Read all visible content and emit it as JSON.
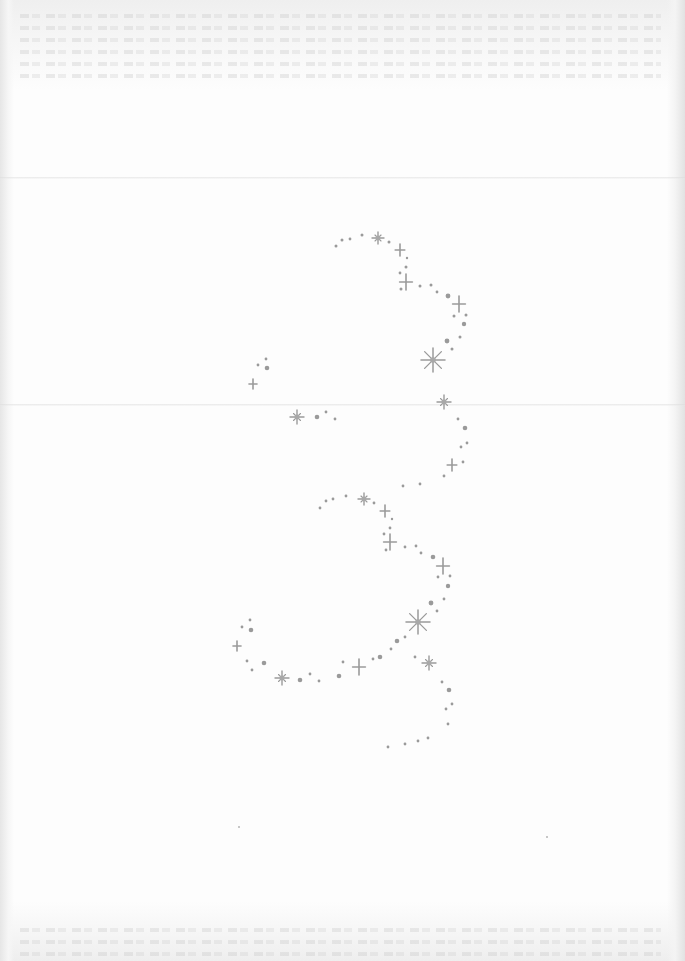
{
  "document": {
    "type": "scanned blank stationery page",
    "background_color": "#fdfdfd",
    "ornament_color": "#9a9a9a",
    "fold_lines_y": [
      177,
      404
    ],
    "bleed_through_rows_y": [
      14,
      26,
      38,
      50,
      62,
      74,
      928,
      940,
      952
    ],
    "specks": [
      {
        "x": 238,
        "y": 826
      },
      {
        "x": 546,
        "y": 836
      }
    ]
  },
  "ornament": {
    "name": "sparkle swirl",
    "stars": [
      {
        "x": 378,
        "y": 238,
        "r": 6,
        "kind": "burst"
      },
      {
        "x": 400,
        "y": 250,
        "r": 6,
        "kind": "cross"
      },
      {
        "x": 406,
        "y": 282,
        "r": 8,
        "kind": "cross"
      },
      {
        "x": 459,
        "y": 304,
        "r": 8,
        "kind": "cross"
      },
      {
        "x": 433,
        "y": 360,
        "r": 12,
        "kind": "burst8"
      },
      {
        "x": 253,
        "y": 384,
        "r": 5,
        "kind": "cross"
      },
      {
        "x": 297,
        "y": 417,
        "r": 7,
        "kind": "burst"
      },
      {
        "x": 444,
        "y": 402,
        "r": 7,
        "kind": "burst"
      },
      {
        "x": 452,
        "y": 465,
        "r": 6,
        "kind": "cross"
      },
      {
        "x": 364,
        "y": 499,
        "r": 6,
        "kind": "burst"
      },
      {
        "x": 385,
        "y": 511,
        "r": 6,
        "kind": "cross"
      },
      {
        "x": 390,
        "y": 542,
        "r": 8,
        "kind": "cross"
      },
      {
        "x": 443,
        "y": 566,
        "r": 8,
        "kind": "cross"
      },
      {
        "x": 418,
        "y": 622,
        "r": 12,
        "kind": "burst8"
      },
      {
        "x": 237,
        "y": 646,
        "r": 5,
        "kind": "cross"
      },
      {
        "x": 282,
        "y": 678,
        "r": 7,
        "kind": "burst"
      },
      {
        "x": 359,
        "y": 667,
        "r": 8,
        "kind": "cross"
      },
      {
        "x": 429,
        "y": 663,
        "r": 7,
        "kind": "burst"
      }
    ],
    "dots": [
      {
        "x": 336,
        "y": 246,
        "r": 1.5
      },
      {
        "x": 342,
        "y": 240,
        "r": 1.5
      },
      {
        "x": 350,
        "y": 239,
        "r": 1.4
      },
      {
        "x": 362,
        "y": 235,
        "r": 1.5
      },
      {
        "x": 389,
        "y": 242,
        "r": 1.5
      },
      {
        "x": 407,
        "y": 258,
        "r": 1.2
      },
      {
        "x": 406,
        "y": 267,
        "r": 1.5
      },
      {
        "x": 400,
        "y": 273,
        "r": 1.4
      },
      {
        "x": 401,
        "y": 289,
        "r": 1.5
      },
      {
        "x": 420,
        "y": 286,
        "r": 1.5
      },
      {
        "x": 431,
        "y": 285,
        "r": 1.5
      },
      {
        "x": 437,
        "y": 292,
        "r": 1.4
      },
      {
        "x": 448,
        "y": 296,
        "r": 2.4
      },
      {
        "x": 454,
        "y": 316,
        "r": 1.5
      },
      {
        "x": 466,
        "y": 315,
        "r": 1.5
      },
      {
        "x": 464,
        "y": 324,
        "r": 2.2
      },
      {
        "x": 460,
        "y": 337,
        "r": 1.5
      },
      {
        "x": 447,
        "y": 341,
        "r": 2.4
      },
      {
        "x": 452,
        "y": 349,
        "r": 1.5
      },
      {
        "x": 266,
        "y": 359,
        "r": 1.4
      },
      {
        "x": 258,
        "y": 365,
        "r": 1.4
      },
      {
        "x": 267,
        "y": 368,
        "r": 2.3
      },
      {
        "x": 317,
        "y": 417,
        "r": 2.3
      },
      {
        "x": 326,
        "y": 412,
        "r": 1.4
      },
      {
        "x": 335,
        "y": 419,
        "r": 1.4
      },
      {
        "x": 458,
        "y": 419,
        "r": 1.4
      },
      {
        "x": 465,
        "y": 428,
        "r": 2.3
      },
      {
        "x": 467,
        "y": 443,
        "r": 1.4
      },
      {
        "x": 461,
        "y": 447,
        "r": 1.4
      },
      {
        "x": 463,
        "y": 462,
        "r": 1.4
      },
      {
        "x": 444,
        "y": 476,
        "r": 1.4
      },
      {
        "x": 420,
        "y": 484,
        "r": 1.4
      },
      {
        "x": 403,
        "y": 486,
        "r": 1.4
      },
      {
        "x": 320,
        "y": 508,
        "r": 1.4
      },
      {
        "x": 326,
        "y": 501,
        "r": 1.4
      },
      {
        "x": 333,
        "y": 499,
        "r": 1.4
      },
      {
        "x": 346,
        "y": 496,
        "r": 1.4
      },
      {
        "x": 374,
        "y": 503,
        "r": 1.4
      },
      {
        "x": 392,
        "y": 519,
        "r": 1.2
      },
      {
        "x": 390,
        "y": 528,
        "r": 1.4
      },
      {
        "x": 384,
        "y": 534,
        "r": 1.4
      },
      {
        "x": 386,
        "y": 550,
        "r": 1.4
      },
      {
        "x": 405,
        "y": 547,
        "r": 1.4
      },
      {
        "x": 416,
        "y": 546,
        "r": 1.4
      },
      {
        "x": 421,
        "y": 553,
        "r": 1.4
      },
      {
        "x": 433,
        "y": 557,
        "r": 2.3
      },
      {
        "x": 438,
        "y": 577,
        "r": 1.4
      },
      {
        "x": 450,
        "y": 576,
        "r": 1.4
      },
      {
        "x": 448,
        "y": 586,
        "r": 2.2
      },
      {
        "x": 444,
        "y": 599,
        "r": 1.4
      },
      {
        "x": 431,
        "y": 603,
        "r": 2.4
      },
      {
        "x": 437,
        "y": 611,
        "r": 1.4
      },
      {
        "x": 397,
        "y": 641,
        "r": 2.3
      },
      {
        "x": 405,
        "y": 637,
        "r": 1.4
      },
      {
        "x": 250,
        "y": 620,
        "r": 1.4
      },
      {
        "x": 242,
        "y": 627,
        "r": 1.4
      },
      {
        "x": 251,
        "y": 630,
        "r": 2.3
      },
      {
        "x": 247,
        "y": 661,
        "r": 1.4
      },
      {
        "x": 264,
        "y": 663,
        "r": 2.3
      },
      {
        "x": 252,
        "y": 670,
        "r": 1.4
      },
      {
        "x": 300,
        "y": 680,
        "r": 2.3
      },
      {
        "x": 310,
        "y": 674,
        "r": 1.4
      },
      {
        "x": 319,
        "y": 681,
        "r": 1.4
      },
      {
        "x": 339,
        "y": 676,
        "r": 2.3
      },
      {
        "x": 343,
        "y": 662,
        "r": 1.4
      },
      {
        "x": 373,
        "y": 659,
        "r": 1.4
      },
      {
        "x": 380,
        "y": 657,
        "r": 2.3
      },
      {
        "x": 391,
        "y": 649,
        "r": 1.4
      },
      {
        "x": 415,
        "y": 657,
        "r": 1.4
      },
      {
        "x": 442,
        "y": 682,
        "r": 1.4
      },
      {
        "x": 449,
        "y": 690,
        "r": 2.3
      },
      {
        "x": 452,
        "y": 704,
        "r": 1.4
      },
      {
        "x": 446,
        "y": 709,
        "r": 1.4
      },
      {
        "x": 448,
        "y": 724,
        "r": 1.4
      },
      {
        "x": 428,
        "y": 738,
        "r": 1.4
      },
      {
        "x": 418,
        "y": 741,
        "r": 1.4
      },
      {
        "x": 405,
        "y": 744,
        "r": 1.4
      },
      {
        "x": 388,
        "y": 747,
        "r": 1.4
      }
    ]
  }
}
